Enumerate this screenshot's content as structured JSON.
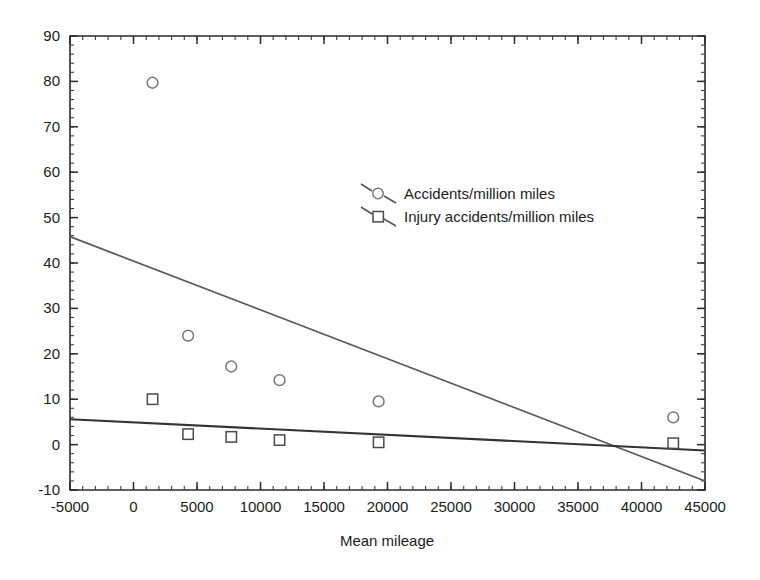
{
  "chart_data": {
    "type": "scatter",
    "title": "",
    "xlabel": "Mean mileage",
    "ylabel": "",
    "xlim": [
      -5000,
      45000
    ],
    "ylim": [
      -10,
      90
    ],
    "xticks": [
      -5000,
      0,
      5000,
      10000,
      15000,
      20000,
      25000,
      30000,
      35000,
      40000,
      45000
    ],
    "xtick_labels": [
      "-5000",
      "0",
      "5000",
      "10000",
      "15000",
      "20000",
      "25000",
      "30000",
      "35000",
      "40000",
      "45000"
    ],
    "yticks": [
      -10,
      0,
      10,
      20,
      30,
      40,
      50,
      60,
      70,
      80,
      90
    ],
    "ytick_labels": [
      "-10",
      "0",
      "10",
      "20",
      "30",
      "40",
      "50",
      "60",
      "70",
      "80",
      "90"
    ],
    "x_minor_step": 1000,
    "y_minor_step": 2,
    "grid": false,
    "legend_position": "center",
    "series": [
      {
        "name": "Accidents/million miles",
        "marker": "circle",
        "marker_color": "#777777",
        "line_color": "#585858",
        "x": [
          1500,
          4300,
          7700,
          11500,
          19300,
          42500
        ],
        "y": [
          79.7,
          24.0,
          17.2,
          14.2,
          9.5,
          6.0
        ],
        "trendline": {
          "x": [
            -5000,
            45000
          ],
          "y": [
            45.8,
            -8.0
          ]
        }
      },
      {
        "name": "Injury accidents/million miles",
        "marker": "square",
        "marker_color": "#4a4a4a",
        "line_color": "#333333",
        "x": [
          1500,
          4300,
          7700,
          11500,
          19300,
          42500
        ],
        "y": [
          10.0,
          2.3,
          1.7,
          1.0,
          0.5,
          0.3
        ],
        "trendline": {
          "x": [
            -5000,
            45000
          ],
          "y": [
            5.6,
            -1.3
          ]
        }
      }
    ]
  },
  "legend": {
    "entries": [
      {
        "label": "Accidents/million miles",
        "marker": "circle-marker-icon"
      },
      {
        "label": "Injury accidents/million miles",
        "marker": "square-marker-icon"
      }
    ]
  },
  "axes": {
    "x_title": "Mean mileage"
  },
  "colors": {
    "background": "#ffffff",
    "frame": "#2b2b2b",
    "text": "#1c1c1c",
    "accidents_line": "#585858",
    "injury_line": "#333333",
    "accidents_marker": "#777777",
    "injury_marker": "#4a4a4a"
  }
}
